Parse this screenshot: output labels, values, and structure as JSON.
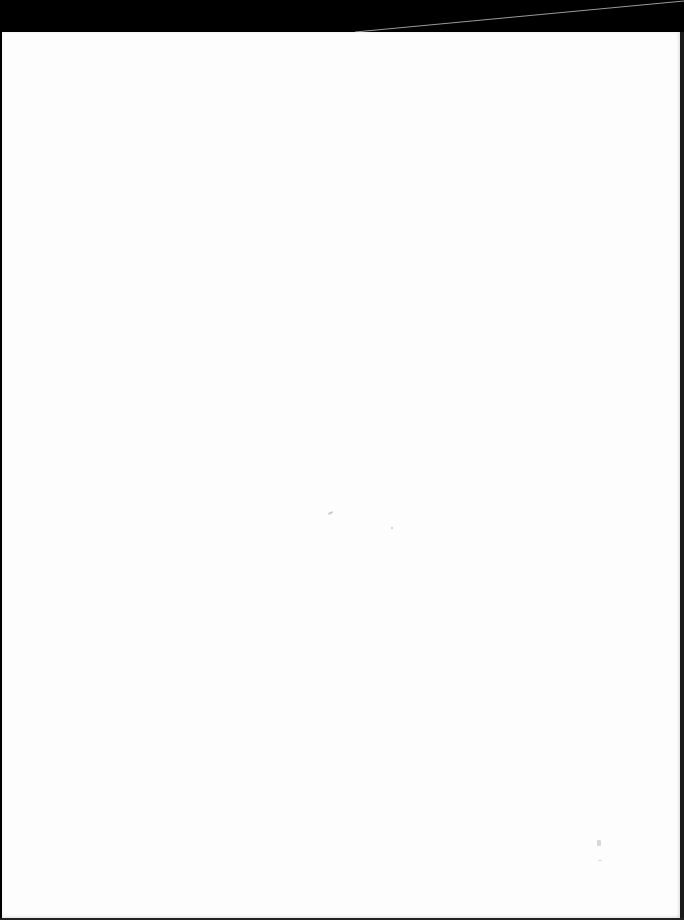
{
  "document": {
    "type": "scanned-page",
    "content_text": "",
    "background_color": "#fdfdfd",
    "border_color": "#000000"
  },
  "artifacts": {
    "specks": [
      {
        "x": 328,
        "y": 512,
        "w": 5,
        "h": 2
      },
      {
        "x": 391,
        "y": 527,
        "w": 2,
        "h": 2
      },
      {
        "x": 597,
        "y": 840,
        "w": 4,
        "h": 6
      },
      {
        "x": 598,
        "y": 860,
        "w": 4,
        "h": 1
      }
    ]
  }
}
